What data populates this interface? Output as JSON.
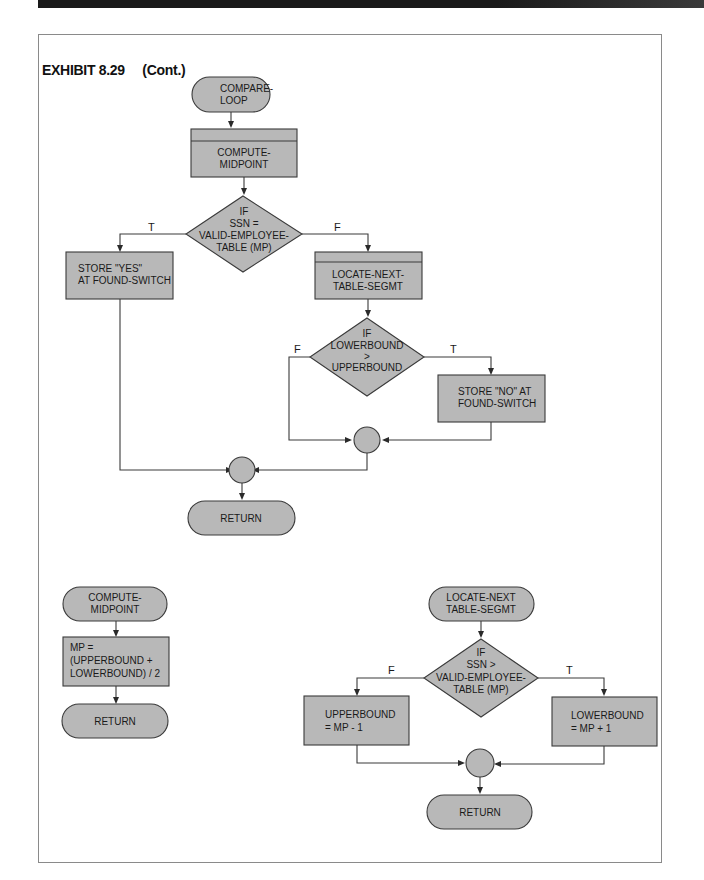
{
  "header": {
    "exhibit_number": "EXHIBIT 8.29",
    "exhibit_suffix": "(Cont.)"
  },
  "colors": {
    "shape_fill": "#b8b8b8",
    "stroke": "#3a3a3a",
    "top_bar": "#1a1a1a"
  },
  "main_flow": {
    "start": [
      "COMPARE-",
      "LOOP"
    ],
    "compute_midpoint": [
      "COMPUTE-",
      "MIDPOINT"
    ],
    "decision_equal": [
      "IF",
      "SSN  =",
      "VALID-EMPLOYEE-",
      "TABLE (MP)"
    ],
    "true_label": "T",
    "false_label": "F",
    "store_yes": [
      "STORE \"YES\"",
      "AT FOUND-SWITCH"
    ],
    "locate_next": [
      "LOCATE-NEXT-",
      "TABLE-SEGMT"
    ],
    "decision_bounds": [
      "IF",
      "LOWERBOUND",
      ">",
      "UPPERBOUND"
    ],
    "bounds_false_label": "F",
    "bounds_true_label": "T",
    "store_no": [
      "STORE \"NO\" AT",
      "FOUND-SWITCH"
    ],
    "end": "RETURN"
  },
  "compute_midpoint_flow": {
    "start": [
      "COMPUTE-",
      "MIDPOINT"
    ],
    "process": [
      "MP  =",
      "(UPPERBOUND  +",
      "LOWERBOUND) / 2"
    ],
    "end": "RETURN"
  },
  "locate_next_flow": {
    "start": [
      "LOCATE-NEXT",
      "TABLE-SEGMT"
    ],
    "decision": [
      "IF",
      "SSN >",
      "VALID-EMPLOYEE-",
      "TABLE (MP)"
    ],
    "false_label": "F",
    "true_label": "T",
    "false_process": [
      "UPPERBOUND",
      "=  MP  -  1"
    ],
    "true_process": [
      "LOWERBOUND",
      "=  MP  +  1"
    ],
    "end": "RETURN"
  }
}
